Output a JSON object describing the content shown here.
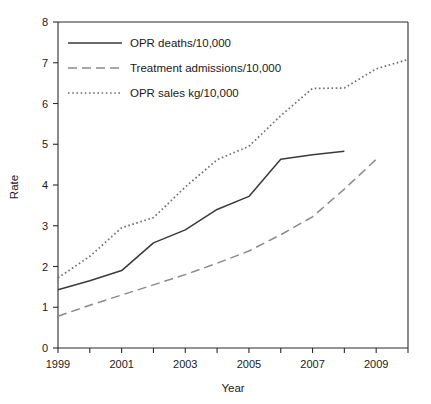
{
  "chart_data": {
    "type": "line",
    "title": "",
    "xlabel": "Year",
    "ylabel": "Rate",
    "xlim": [
      1999,
      2010
    ],
    "ylim": [
      0,
      8
    ],
    "grid": false,
    "legend_position": "top-left",
    "x": [
      1999,
      2000,
      2001,
      2002,
      2003,
      2004,
      2005,
      2006,
      2007,
      2008,
      2009,
      2010
    ],
    "xticks": [
      1999,
      2000,
      2001,
      2002,
      2003,
      2004,
      2005,
      2006,
      2007,
      2008,
      2009,
      2010
    ],
    "xtick_labels": [
      "1999",
      "",
      "2001",
      "",
      "2003",
      "",
      "2005",
      "",
      "2007",
      "",
      "2009",
      ""
    ],
    "yticks": [
      0,
      1,
      2,
      3,
      4,
      5,
      6,
      7,
      8
    ],
    "ytick_labels": [
      "0",
      "1",
      "2",
      "3",
      "4",
      "5",
      "6",
      "7",
      "8"
    ],
    "series": [
      {
        "name": "OPR deaths/10,000",
        "style": "solid",
        "color": "#3a3a3a",
        "x": [
          1999,
          2000,
          2001,
          2002,
          2003,
          2004,
          2005,
          2006,
          2007,
          2008
        ],
        "values": [
          1.43,
          1.65,
          1.9,
          2.58,
          2.9,
          3.4,
          3.72,
          4.63,
          4.74,
          4.83
        ]
      },
      {
        "name": "Treatment admissions/10,000",
        "style": "dashed",
        "color": "#8a8a8a",
        "x": [
          1999,
          2000,
          2001,
          2002,
          2003,
          2004,
          2005,
          2006,
          2007,
          2008,
          2009
        ],
        "values": [
          0.78,
          1.05,
          1.3,
          1.55,
          1.8,
          2.08,
          2.38,
          2.78,
          3.22,
          3.9,
          4.63
        ]
      },
      {
        "name": "OPR sales kg/10,000",
        "style": "dotted",
        "color": "#6e6e6e",
        "x": [
          1999,
          2000,
          2001,
          2002,
          2003,
          2004,
          2005,
          2006,
          2007,
          2008,
          2009,
          2010
        ],
        "values": [
          1.72,
          2.25,
          2.95,
          3.2,
          3.95,
          4.62,
          4.95,
          5.7,
          6.37,
          6.38,
          6.85,
          7.08
        ]
      }
    ]
  }
}
